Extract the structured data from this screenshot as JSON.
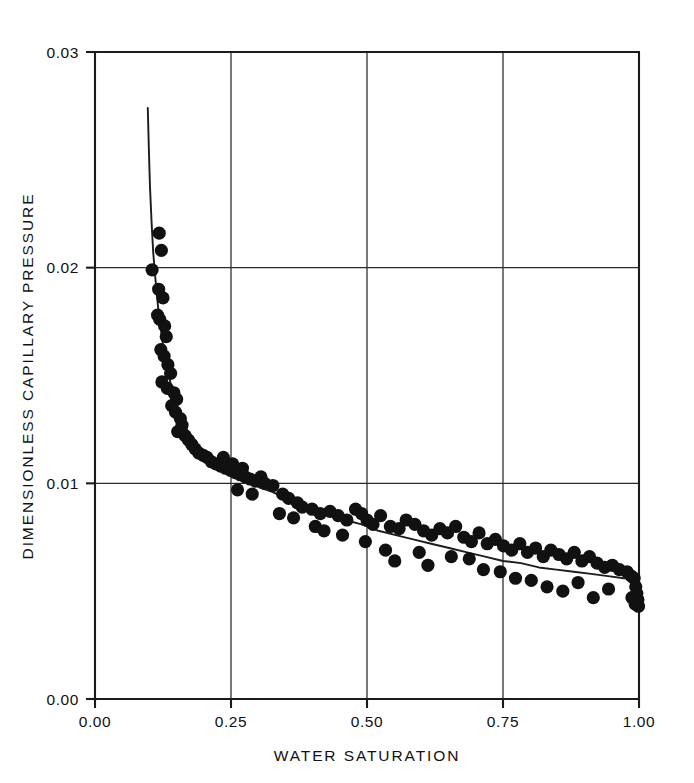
{
  "chart_data": {
    "type": "scatter",
    "title": "",
    "xlabel": "WATER SATURATION",
    "ylabel": "DIMENSIONLESS CAPILLARY PRESSURE",
    "xlim": [
      0.0,
      1.0
    ],
    "ylim": [
      0.0,
      0.03
    ],
    "xticks": [
      0.0,
      0.25,
      0.5,
      0.75,
      1.0
    ],
    "xtick_labels": [
      "0.00",
      "0.25",
      "0.50",
      "0.75",
      "1.00"
    ],
    "yticks": [
      0.0,
      0.01,
      0.02,
      0.03
    ],
    "ytick_labels": [
      "0.00",
      "0.01",
      "0.02",
      "0.03"
    ],
    "grid": true,
    "legend": null,
    "marker_color": "#111111",
    "curve_color": "#1c1c1c",
    "series": [
      {
        "name": "measured data",
        "type": "scatter",
        "marker": "filled-circle",
        "points": [
          [
            0.118,
            0.0216
          ],
          [
            0.122,
            0.0208
          ],
          [
            0.105,
            0.0199
          ],
          [
            0.117,
            0.019
          ],
          [
            0.125,
            0.0186
          ],
          [
            0.115,
            0.0178
          ],
          [
            0.119,
            0.0176
          ],
          [
            0.128,
            0.0173
          ],
          [
            0.131,
            0.0168
          ],
          [
            0.121,
            0.0162
          ],
          [
            0.127,
            0.0159
          ],
          [
            0.134,
            0.0155
          ],
          [
            0.139,
            0.0151
          ],
          [
            0.123,
            0.0147
          ],
          [
            0.133,
            0.0144
          ],
          [
            0.145,
            0.0142
          ],
          [
            0.15,
            0.0139
          ],
          [
            0.141,
            0.0136
          ],
          [
            0.148,
            0.0133
          ],
          [
            0.157,
            0.013
          ],
          [
            0.16,
            0.0127
          ],
          [
            0.152,
            0.0124
          ],
          [
            0.166,
            0.0122
          ],
          [
            0.172,
            0.012
          ],
          [
            0.178,
            0.0118
          ],
          [
            0.184,
            0.0116
          ],
          [
            0.191,
            0.0114
          ],
          [
            0.199,
            0.0113
          ],
          [
            0.206,
            0.0112
          ],
          [
            0.214,
            0.011
          ],
          [
            0.222,
            0.0109
          ],
          [
            0.231,
            0.0108
          ],
          [
            0.24,
            0.0107
          ],
          [
            0.249,
            0.0106
          ],
          [
            0.236,
            0.0112
          ],
          [
            0.258,
            0.0105
          ],
          [
            0.267,
            0.0104
          ],
          [
            0.253,
            0.0109
          ],
          [
            0.276,
            0.0103
          ],
          [
            0.285,
            0.0102
          ],
          [
            0.271,
            0.0107
          ],
          [
            0.295,
            0.0101
          ],
          [
            0.305,
            0.0103
          ],
          [
            0.312,
            0.01
          ],
          [
            0.262,
            0.0097
          ],
          [
            0.289,
            0.0095
          ],
          [
            0.327,
            0.0099
          ],
          [
            0.345,
            0.0095
          ],
          [
            0.356,
            0.0093
          ],
          [
            0.372,
            0.0091
          ],
          [
            0.381,
            0.0089
          ],
          [
            0.339,
            0.0086
          ],
          [
            0.399,
            0.0088
          ],
          [
            0.365,
            0.0084
          ],
          [
            0.414,
            0.0086
          ],
          [
            0.405,
            0.008
          ],
          [
            0.432,
            0.0087
          ],
          [
            0.447,
            0.0085
          ],
          [
            0.463,
            0.0083
          ],
          [
            0.421,
            0.0078
          ],
          [
            0.479,
            0.0088
          ],
          [
            0.49,
            0.0086
          ],
          [
            0.455,
            0.0076
          ],
          [
            0.5,
            0.0083
          ],
          [
            0.511,
            0.0081
          ],
          [
            0.497,
            0.0073
          ],
          [
            0.525,
            0.0085
          ],
          [
            0.543,
            0.008
          ],
          [
            0.534,
            0.0069
          ],
          [
            0.559,
            0.0079
          ],
          [
            0.572,
            0.0083
          ],
          [
            0.551,
            0.0064
          ],
          [
            0.588,
            0.0081
          ],
          [
            0.604,
            0.0078
          ],
          [
            0.619,
            0.0076
          ],
          [
            0.596,
            0.0068
          ],
          [
            0.634,
            0.0079
          ],
          [
            0.648,
            0.0077
          ],
          [
            0.612,
            0.0062
          ],
          [
            0.663,
            0.008
          ],
          [
            0.678,
            0.0075
          ],
          [
            0.655,
            0.0066
          ],
          [
            0.692,
            0.0073
          ],
          [
            0.706,
            0.0077
          ],
          [
            0.688,
            0.0065
          ],
          [
            0.721,
            0.0072
          ],
          [
            0.736,
            0.0074
          ],
          [
            0.714,
            0.006
          ],
          [
            0.751,
            0.0071
          ],
          [
            0.766,
            0.0069
          ],
          [
            0.745,
            0.0059
          ],
          [
            0.781,
            0.0072
          ],
          [
            0.795,
            0.0068
          ],
          [
            0.773,
            0.0056
          ],
          [
            0.81,
            0.007
          ],
          [
            0.824,
            0.0066
          ],
          [
            0.802,
            0.0055
          ],
          [
            0.838,
            0.0069
          ],
          [
            0.853,
            0.0067
          ],
          [
            0.831,
            0.0052
          ],
          [
            0.867,
            0.0065
          ],
          [
            0.881,
            0.0068
          ],
          [
            0.86,
            0.005
          ],
          [
            0.895,
            0.0064
          ],
          [
            0.909,
            0.0066
          ],
          [
            0.888,
            0.0054
          ],
          [
            0.923,
            0.0063
          ],
          [
            0.937,
            0.0061
          ],
          [
            0.916,
            0.0047
          ],
          [
            0.951,
            0.0062
          ],
          [
            0.964,
            0.006
          ],
          [
            0.944,
            0.0051
          ],
          [
            0.978,
            0.0059
          ],
          [
            0.986,
            0.0057
          ],
          [
            0.991,
            0.0056
          ],
          [
            0.994,
            0.0052
          ],
          [
            0.996,
            0.0049
          ],
          [
            0.998,
            0.0046
          ],
          [
            0.999,
            0.0043
          ],
          [
            0.993,
            0.0044
          ],
          [
            0.987,
            0.0047
          ]
        ]
      },
      {
        "name": "fitted curve",
        "type": "line",
        "points": [
          [
            0.097,
            0.0274
          ],
          [
            0.099,
            0.0255
          ],
          [
            0.101,
            0.0238
          ],
          [
            0.104,
            0.0221
          ],
          [
            0.107,
            0.0207
          ],
          [
            0.111,
            0.0195
          ],
          [
            0.115,
            0.0184
          ],
          [
            0.119,
            0.0175
          ],
          [
            0.124,
            0.0166
          ],
          [
            0.129,
            0.0158
          ],
          [
            0.135,
            0.0151
          ],
          [
            0.141,
            0.0144
          ],
          [
            0.148,
            0.0138
          ],
          [
            0.156,
            0.0132
          ],
          [
            0.165,
            0.0127
          ],
          [
            0.175,
            0.0122
          ],
          [
            0.186,
            0.0118
          ],
          [
            0.198,
            0.0114
          ],
          [
            0.212,
            0.0111
          ],
          [
            0.227,
            0.0108
          ],
          [
            0.244,
            0.0106
          ],
          [
            0.262,
            0.0103
          ],
          [
            0.282,
            0.0101
          ],
          [
            0.303,
            0.0098
          ],
          [
            0.326,
            0.0096
          ],
          [
            0.35,
            0.0093
          ],
          [
            0.376,
            0.0091
          ],
          [
            0.403,
            0.0088
          ],
          [
            0.431,
            0.0086
          ],
          [
            0.46,
            0.0083
          ],
          [
            0.49,
            0.0081
          ],
          [
            0.521,
            0.0078
          ],
          [
            0.553,
            0.0076
          ],
          [
            0.585,
            0.0074
          ],
          [
            0.618,
            0.0072
          ],
          [
            0.651,
            0.007
          ],
          [
            0.684,
            0.0068
          ],
          [
            0.717,
            0.0066
          ],
          [
            0.75,
            0.0064
          ],
          [
            0.783,
            0.0063
          ],
          [
            0.816,
            0.0061
          ],
          [
            0.848,
            0.006
          ],
          [
            0.88,
            0.0059
          ],
          [
            0.912,
            0.0058
          ],
          [
            0.943,
            0.0057
          ],
          [
            0.972,
            0.0056
          ],
          [
            1.0,
            0.0056
          ]
        ]
      }
    ]
  }
}
